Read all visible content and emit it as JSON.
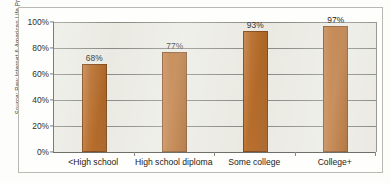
{
  "source_caption": "Source: Pew Internet & American Life Project",
  "colors": {
    "bar_fill": "#b4651f",
    "bar_stroke": "#7d4312",
    "plot_background": "#e9e9e1",
    "gridline": "#83837e",
    "axis": "#6f6f6a",
    "frame": "#b9b9b4",
    "text": "#232320"
  },
  "chart_data": {
    "type": "bar",
    "title": "",
    "subtitle": "",
    "xlabel": "",
    "ylabel": "",
    "categories": [
      "<High school",
      "High school diploma",
      "Some college",
      "College+"
    ],
    "values": [
      68,
      77,
      93,
      97
    ],
    "value_labels": [
      "68%",
      "77%",
      "93%",
      "97%"
    ],
    "ylim": [
      0,
      100
    ],
    "ytick_values": [
      100,
      80,
      60,
      40,
      20,
      0
    ],
    "ytick_labels": [
      "100%",
      "80%",
      "60%",
      "40%",
      "20%",
      "0%"
    ],
    "grid": true,
    "grid_axis": "y",
    "legend": false,
    "legend_position": "none",
    "series": [
      {
        "name": "Internet use",
        "values": [
          68,
          77,
          93,
          97
        ]
      }
    ],
    "annotations": [
      "Source: Pew Internet & American Life Project"
    ]
  }
}
